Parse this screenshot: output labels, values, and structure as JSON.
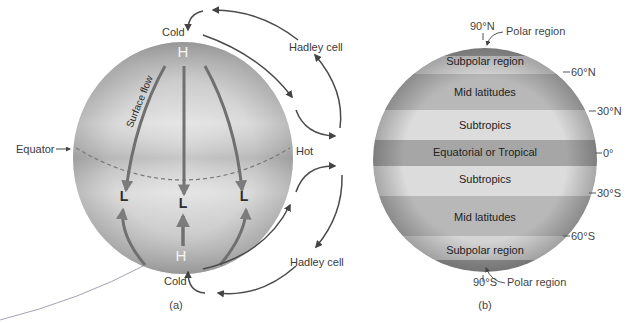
{
  "panel_a": {
    "label": "(a)",
    "top_label": "Cold",
    "bottom_label": "Cold",
    "top_high": "H",
    "bottom_high": "H",
    "lows": [
      "L",
      "L",
      "L"
    ],
    "equator_label": "Equator",
    "hot_label": "Hot",
    "surface_flow_label": "Surface flow",
    "hadley_top": "Hadley cell",
    "hadley_bottom": "Hadley cell"
  },
  "panel_b": {
    "label": "(b)",
    "bands": [
      {
        "name": "Subpolar region"
      },
      {
        "name": "Mid latitudes"
      },
      {
        "name": "Subtropics"
      },
      {
        "name": "Equatorial or Tropical"
      },
      {
        "name": "Subtropics"
      },
      {
        "name": "Mid latitudes"
      },
      {
        "name": "Subpolar region"
      }
    ],
    "latitudes": {
      "n90": "90°N",
      "n60": "60°N",
      "n30": "30°N",
      "eq": "0°",
      "s30": "30°S",
      "s60": "60°S",
      "s90": "90°S"
    },
    "polar_top": "Polar region",
    "polar_bottom": "Polar region"
  }
}
